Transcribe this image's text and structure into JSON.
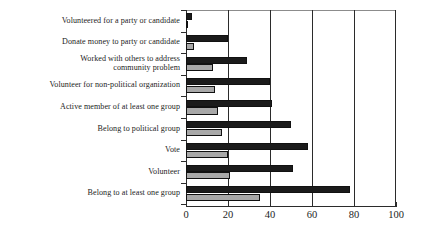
{
  "chart_data": {
    "type": "bar",
    "orientation": "horizontal",
    "title": "",
    "subtitle": "",
    "xlabel": "",
    "ylabel": "",
    "xlim": [
      0,
      100
    ],
    "xticks": [
      "0",
      "20",
      "40",
      "60",
      "80",
      "100"
    ],
    "xtick_values": [
      0,
      20,
      40,
      60,
      80,
      100
    ],
    "grid": true,
    "grid_axis": "x",
    "legend": "none",
    "categories": [
      "Volunteered for a party or candidate",
      "Donate money to party or candidate",
      "Worked with others to address\ncommunity problem",
      "Volunteer for non-political organization",
      "Active member of at least one group",
      "Belong to political group",
      "Vote",
      "Volunteer",
      "Belong to at least one group"
    ],
    "category_lines": [
      [
        "Volunteered for a party or candidate"
      ],
      [
        "Donate money to party or candidate"
      ],
      [
        "Worked with others to address",
        "community problem"
      ],
      [
        "Volunteer for non-political organization"
      ],
      [
        "Active member of at least one group"
      ],
      [
        "Belong to political group"
      ],
      [
        "Vote"
      ],
      [
        "Volunteer"
      ],
      [
        "Belong to at least one group"
      ]
    ],
    "series": [
      {
        "name": "dark",
        "color": "#1b1b1b",
        "values": [
          3,
          20,
          29,
          40,
          41,
          50,
          58,
          51,
          78
        ]
      },
      {
        "name": "light",
        "color": "#a8a8a8",
        "values": [
          1,
          4,
          13,
          14,
          15,
          17,
          20,
          21,
          35
        ]
      }
    ]
  },
  "axis": {
    "tick_labels": [
      "0",
      "20",
      "40",
      "60",
      "80",
      "100"
    ]
  },
  "colors": {
    "dark_bar": "#1b1b1b",
    "light_bar": "#a8a8a8",
    "axis": "#2b2b2b",
    "text": "#1d1d1d",
    "background": "#ffffff"
  }
}
